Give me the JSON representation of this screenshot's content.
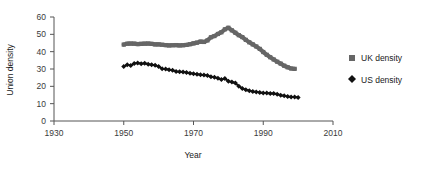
{
  "chart_data": {
    "type": "line",
    "title": "",
    "xlabel": "Year",
    "ylabel": "Union density",
    "xlim": [
      1930,
      2010
    ],
    "ylim": [
      0,
      60
    ],
    "xticks": [
      1930,
      1950,
      1970,
      1990,
      2010
    ],
    "yticks": [
      0,
      10,
      20,
      30,
      40,
      50,
      60
    ],
    "grid": false,
    "legend_position": "right",
    "series": [
      {
        "name": "UK density",
        "marker": "square",
        "color": "#666666",
        "x": [
          1950,
          1951,
          1952,
          1953,
          1954,
          1955,
          1956,
          1957,
          1958,
          1959,
          1960,
          1961,
          1962,
          1963,
          1964,
          1965,
          1966,
          1967,
          1968,
          1969,
          1970,
          1971,
          1972,
          1973,
          1974,
          1975,
          1976,
          1977,
          1978,
          1979,
          1980,
          1981,
          1982,
          1983,
          1984,
          1985,
          1986,
          1987,
          1988,
          1989,
          1990,
          1991,
          1992,
          1993,
          1994,
          1995,
          1996,
          1997,
          1998,
          1999
        ],
        "values": [
          44.1,
          44.6,
          44.7,
          44.6,
          44.4,
          44.5,
          44.6,
          44.7,
          44.5,
          44.2,
          44.2,
          44.0,
          43.8,
          43.6,
          43.7,
          43.8,
          43.6,
          43.7,
          43.9,
          44.3,
          44.8,
          45.2,
          45.8,
          45.6,
          46.5,
          48.3,
          49.0,
          50.2,
          51.2,
          52.9,
          53.8,
          52.3,
          50.9,
          49.5,
          48.4,
          46.8,
          45.4,
          44.2,
          43.0,
          41.6,
          39.8,
          38.2,
          36.8,
          35.5,
          34.2,
          33.1,
          31.9,
          31.0,
          30.3,
          30.1
        ]
      },
      {
        "name": "US density",
        "marker": "diamond",
        "color": "#111111",
        "x": [
          1950,
          1951,
          1952,
          1953,
          1954,
          1955,
          1956,
          1957,
          1958,
          1959,
          1960,
          1961,
          1962,
          1963,
          1964,
          1965,
          1966,
          1967,
          1968,
          1969,
          1970,
          1971,
          1972,
          1973,
          1974,
          1975,
          1976,
          1977,
          1978,
          1979,
          1980,
          1981,
          1982,
          1983,
          1984,
          1985,
          1986,
          1987,
          1988,
          1989,
          1990,
          1991,
          1992,
          1993,
          1994,
          1995,
          1996,
          1997,
          1998,
          1999,
          2000
        ],
        "values": [
          31.5,
          32.4,
          32.0,
          33.2,
          33.5,
          33.1,
          33.3,
          32.8,
          32.5,
          32.2,
          31.4,
          30.2,
          30.0,
          29.6,
          29.3,
          28.6,
          28.4,
          28.2,
          28.0,
          27.6,
          27.3,
          27.0,
          26.7,
          26.5,
          26.2,
          25.5,
          25.3,
          24.7,
          23.9,
          24.5,
          23.0,
          22.5,
          21.9,
          20.1,
          18.8,
          18.0,
          17.5,
          17.0,
          16.8,
          16.4,
          16.1,
          16.1,
          15.8,
          15.8,
          15.5,
          14.9,
          14.5,
          14.1,
          13.9,
          13.9,
          13.5
        ]
      }
    ]
  },
  "legend": {
    "items": [
      {
        "label": "UK density",
        "marker": "square",
        "color": "#666666"
      },
      {
        "label": "US density",
        "marker": "diamond",
        "color": "#111111"
      }
    ]
  },
  "axes": {
    "x_title": "Year",
    "y_title": "Union density",
    "x_tick_labels": [
      "1930",
      "1950",
      "1970",
      "1990",
      "2010"
    ],
    "y_tick_labels": [
      "0",
      "10",
      "20",
      "30",
      "40",
      "50",
      "60"
    ]
  }
}
